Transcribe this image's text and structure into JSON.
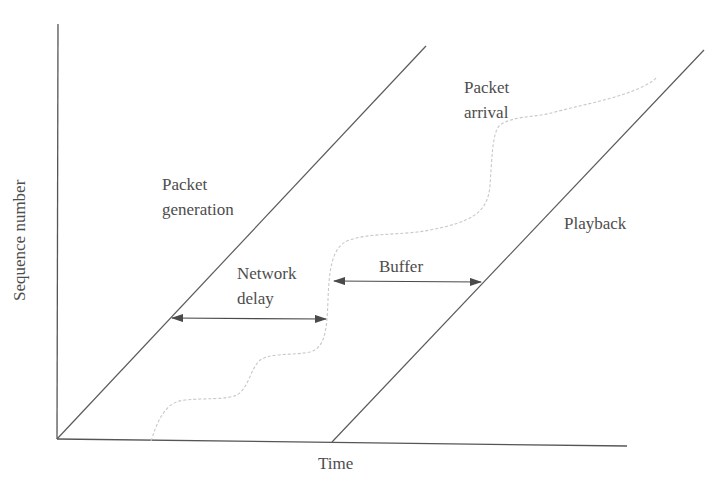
{
  "diagram": {
    "type": "timing-diagram",
    "axes": {
      "x_label": "Time",
      "y_label": "Sequence number"
    },
    "curves": {
      "generation": {
        "label_line1": "Packet",
        "label_line2": "generation",
        "style": "solid"
      },
      "arrival": {
        "label_line1": "Packet",
        "label_line2": "arrival",
        "style": "dashed-light"
      },
      "playback": {
        "label": "Playback",
        "style": "solid"
      }
    },
    "intervals": {
      "network_delay": {
        "label_line1": "Network",
        "label_line2": "delay"
      },
      "buffer": {
        "label": "Buffer"
      }
    },
    "colors": {
      "axis": "#555555",
      "line": "#5a5a5a",
      "arrival_curve": "#c8c8c8",
      "text": "#4d4d4d",
      "background": "#ffffff"
    }
  }
}
